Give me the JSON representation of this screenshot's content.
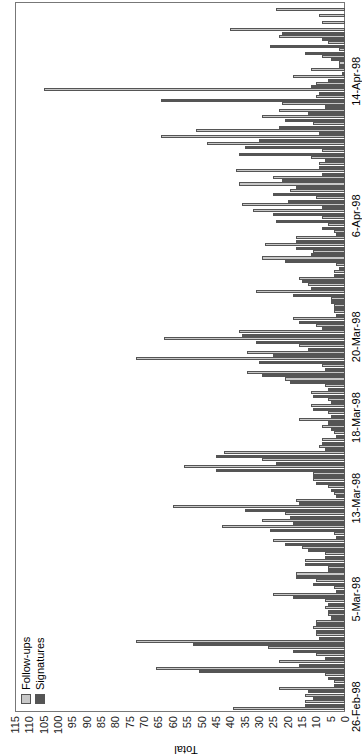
{
  "chart_data": {
    "type": "bar",
    "orientation": "rotated-90-ccw",
    "title": "",
    "xlabel": "",
    "ylabel": "Total",
    "ylim": [
      0,
      115
    ],
    "yticks": [
      0,
      5,
      10,
      15,
      20,
      25,
      30,
      35,
      40,
      45,
      50,
      55,
      60,
      65,
      70,
      75,
      80,
      85,
      90,
      95,
      100,
      105,
      110,
      115
    ],
    "xtick_labels": [
      "26-Feb-98",
      "5-Mar-98",
      "13-Mar-98",
      "18-Mar-98",
      "20-Mar-98",
      "6-Apr-98",
      "14-Apr-98"
    ],
    "legend": [
      "Follow-ups",
      "Signatures"
    ],
    "legend_position": "upper-left",
    "grid": false,
    "series": [
      {
        "name": "Follow-ups",
        "color": "#c8c8c8",
        "values": [
          39,
          14,
          14,
          23,
          4,
          7,
          66,
          23,
          10,
          27,
          73,
          10,
          11,
          10,
          6,
          7,
          7,
          25,
          4,
          10,
          17,
          6,
          14,
          7,
          15,
          25,
          4,
          43,
          29,
          21,
          60,
          17,
          4,
          6,
          11,
          11,
          56,
          29,
          42,
          9,
          8,
          4,
          8,
          16,
          6,
          12,
          6,
          12,
          7,
          21,
          34,
          8,
          73,
          34,
          16,
          63,
          37,
          10,
          18,
          4,
          4,
          5,
          31,
          13,
          16,
          4,
          3,
          29,
          11,
          28,
          17,
          4,
          6,
          8,
          32,
          36,
          10,
          19,
          37,
          25,
          38,
          9,
          12,
          8,
          48,
          64,
          52,
          11,
          29,
          23,
          22,
          10,
          105,
          10,
          18,
          12,
          2,
          8,
          2,
          6,
          23,
          40,
          8,
          9,
          24
        ]
      },
      {
        "name": "Signatures",
        "color": "#555555",
        "values": [
          14,
          11,
          13,
          4,
          6,
          51,
          16,
          7,
          18,
          53,
          9,
          10,
          10,
          5,
          6,
          6,
          18,
          3,
          11,
          17,
          6,
          14,
          7,
          13,
          21,
          3,
          26,
          18,
          19,
          35,
          16,
          3,
          5,
          10,
          11,
          45,
          24,
          45,
          7,
          8,
          3,
          5,
          6,
          5,
          11,
          5,
          11,
          6,
          19,
          29,
          7,
          30,
          25,
          13,
          31,
          36,
          8,
          16,
          3,
          4,
          5,
          18,
          12,
          15,
          4,
          2,
          21,
          12,
          17,
          17,
          3,
          8,
          24,
          25,
          8,
          20,
          25,
          17,
          22,
          8,
          9,
          7,
          37,
          35,
          30,
          9,
          23,
          21,
          13,
          7,
          64,
          9,
          12,
          6,
          1,
          2,
          5,
          14,
          26,
          8,
          22
        ]
      }
    ]
  }
}
